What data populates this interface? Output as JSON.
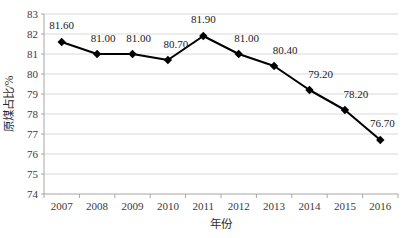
{
  "chart_data": {
    "type": "line",
    "title": "",
    "xlabel": "年份",
    "ylabel": "原煤占比/%",
    "categories": [
      "2007",
      "2008",
      "2009",
      "2010",
      "2011",
      "2012",
      "2013",
      "2014",
      "2015",
      "2016"
    ],
    "values": [
      81.6,
      81.0,
      81.0,
      80.7,
      81.9,
      81.0,
      80.4,
      79.2,
      78.2,
      76.7
    ],
    "data_labels": [
      "81.60",
      "81.00",
      "81.00",
      "80.70",
      "81.90",
      "81.00",
      "80.40",
      "79.20",
      "78.20",
      "76.70"
    ],
    "ylim": [
      74,
      83
    ],
    "ytick_step": 1,
    "ytick_labels": [
      "74",
      "75",
      "76",
      "77",
      "78",
      "79",
      "80",
      "81",
      "82",
      "83"
    ],
    "grid": true,
    "grid_axis": "y",
    "legend": "none",
    "series": [
      {
        "name": "原煤占比",
        "marker": "diamond",
        "line_color": "#000000",
        "marker_color": "#000000",
        "values": [
          81.6,
          81.0,
          81.0,
          80.7,
          81.9,
          81.0,
          80.4,
          79.2,
          78.2,
          76.7
        ]
      }
    ],
    "colors": {
      "line": "#000000",
      "marker": "#000000",
      "grid": "#d9d9d9",
      "axis": "#a6a6a6",
      "background": "#ffffff",
      "text": "#2b2b2b"
    }
  }
}
